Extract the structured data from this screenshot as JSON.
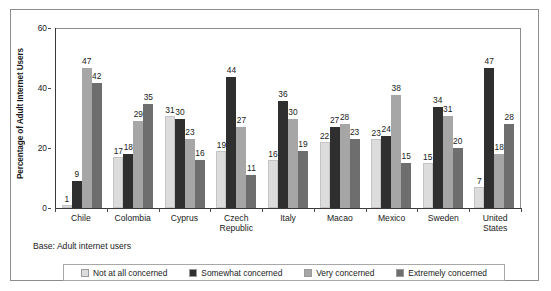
{
  "chart_data": {
    "type": "bar",
    "title": "",
    "xlabel": "",
    "ylabel": "Percentage of Adult Internet Users",
    "ylim": [
      0,
      60
    ],
    "yticks": [
      0,
      20,
      40,
      60
    ],
    "grid": false,
    "legend_position": "bottom",
    "categories": [
      "Chile",
      "Colombia",
      "Cyprus",
      "Czech Republic",
      "Italy",
      "Macao",
      "Mexico",
      "Sweden",
      "United States"
    ],
    "series": [
      {
        "name": "Not at all concerned",
        "color": "#dcdcdc",
        "values": [
          1,
          17,
          31,
          19,
          16,
          22,
          23,
          15,
          7
        ]
      },
      {
        "name": "Somewhat concerned",
        "color": "#2f2f2f",
        "values": [
          9,
          18,
          30,
          44,
          36,
          27,
          24,
          34,
          47
        ]
      },
      {
        "name": "Very concerned",
        "color": "#a6a6a6",
        "values": [
          47,
          29,
          23,
          27,
          30,
          28,
          38,
          31,
          18
        ]
      },
      {
        "name": "Extremely concerned",
        "color": "#6e6e6e",
        "values": [
          42,
          35,
          16,
          11,
          19,
          23,
          15,
          20,
          28
        ]
      }
    ],
    "annotations": {
      "base_note": "Base: Adult internet users"
    }
  },
  "axis": {
    "y_title": "Percentage of Adult Internet Users",
    "y_tick_labels": [
      "0",
      "20",
      "40",
      "60"
    ]
  },
  "x_labels": [
    {
      "line1": "Chile",
      "line2": ""
    },
    {
      "line1": "Colombia",
      "line2": ""
    },
    {
      "line1": "Cyprus",
      "line2": ""
    },
    {
      "line1": "Czech",
      "line2": "Republic"
    },
    {
      "line1": "Italy",
      "line2": ""
    },
    {
      "line1": "Macao",
      "line2": ""
    },
    {
      "line1": "Mexico",
      "line2": ""
    },
    {
      "line1": "Sweden",
      "line2": ""
    },
    {
      "line1": "United",
      "line2": "States"
    }
  ],
  "base_note": "Base: Adult internet users",
  "legend": {
    "items": [
      {
        "label": "Not at all concerned",
        "color": "#dcdcdc"
      },
      {
        "label": "Somewhat concerned",
        "color": "#2f2f2f"
      },
      {
        "label": "Very concerned",
        "color": "#a6a6a6"
      },
      {
        "label": "Extremely concerned",
        "color": "#6e6e6e"
      }
    ]
  }
}
